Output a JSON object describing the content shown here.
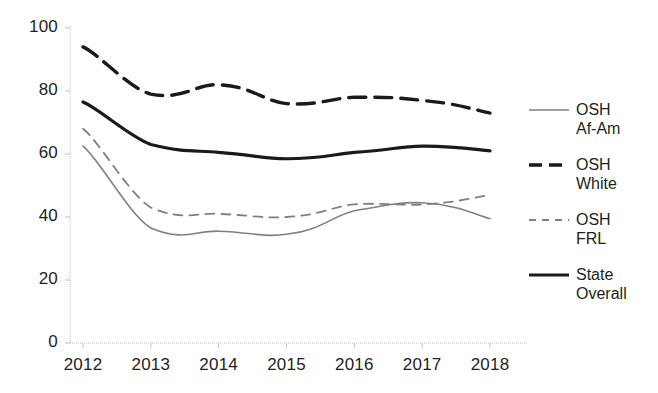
{
  "chart_data": {
    "type": "line",
    "title": "",
    "xlabel": "",
    "ylabel": "",
    "categories": [
      "2012",
      "2013",
      "2014",
      "2015",
      "2016",
      "2017",
      "2018"
    ],
    "x": [
      2012,
      2013,
      2014,
      2015,
      2016,
      2017,
      2018
    ],
    "ylim": [
      0,
      100
    ],
    "yticks": [
      0,
      20,
      40,
      60,
      80,
      100
    ],
    "ytick_labels": [
      "0",
      "20",
      "40",
      "60",
      "80",
      "100"
    ],
    "grid": false,
    "legend_position": "right",
    "series": [
      {
        "name": "OSH Af-Am",
        "label_line1": "OSH",
        "label_line2": "Af-Am",
        "style": "solid",
        "color": "#808080",
        "width": 1.6,
        "values": [
          62.5,
          36.5,
          35.5,
          34.5,
          42.0,
          44.5,
          39.5
        ]
      },
      {
        "name": "OSH White",
        "label_line1": "OSH",
        "label_line2": "White",
        "style": "dashed",
        "color": "#1a1a1a",
        "width": 3.4,
        "values": [
          94.0,
          79.0,
          82.0,
          76.0,
          78.0,
          77.0,
          73.0
        ]
      },
      {
        "name": "OSH FRL",
        "label_line1": "OSH",
        "label_line2": "FRL",
        "style": "dashed",
        "color": "#808080",
        "width": 1.8,
        "values": [
          68.0,
          43.0,
          41.0,
          40.0,
          44.0,
          44.0,
          47.0
        ]
      },
      {
        "name": "State Overall",
        "label_line1": "State",
        "label_line2": "Overall",
        "style": "solid",
        "color": "#1a1a1a",
        "width": 3.2,
        "values": [
          76.5,
          63.0,
          60.5,
          58.5,
          60.5,
          62.5,
          61.0
        ]
      }
    ]
  },
  "axes": {
    "axis_color": "#bfbfbf",
    "tick_color": "#bfbfbf"
  },
  "legend": {
    "entries": [
      {
        "line1": "OSH",
        "line2": "Af-Am"
      },
      {
        "line1": "OSH",
        "line2": "White"
      },
      {
        "line1": "OSH",
        "line2": "FRL"
      },
      {
        "line1": "State",
        "line2": "Overall"
      }
    ]
  }
}
